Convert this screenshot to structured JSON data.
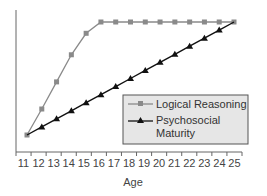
{
  "chart_data": {
    "type": "line",
    "title": "",
    "xlabel": "Age",
    "ylabel": "",
    "x": [
      11,
      12,
      13,
      14,
      15,
      16,
      17,
      18,
      19,
      20,
      21,
      22,
      23,
      24,
      25
    ],
    "ylim": [
      0,
      100
    ],
    "grid": false,
    "legend_position": "lower right (inside plot)",
    "series": [
      {
        "name": "Logical Reasoning",
        "marker": "square",
        "color": "#8a8a8a",
        "values": [
          0,
          23,
          47,
          71,
          90,
          100,
          100,
          100,
          100,
          100,
          100,
          100,
          100,
          100,
          100
        ]
      },
      {
        "name": "Psychosocial Maturity",
        "marker": "triangle",
        "color": "#111111",
        "values": [
          0,
          7.1,
          14.3,
          21.4,
          28.6,
          35.7,
          42.9,
          50,
          57.1,
          64.3,
          71.4,
          78.6,
          85.7,
          92.9,
          100
        ]
      }
    ]
  },
  "legend": {
    "items": [
      {
        "label_lines": [
          "Logical Reasoning"
        ]
      },
      {
        "label_lines": [
          "Psychosocial",
          "Maturity"
        ]
      }
    ]
  },
  "axis": {
    "x_title": "Age"
  }
}
